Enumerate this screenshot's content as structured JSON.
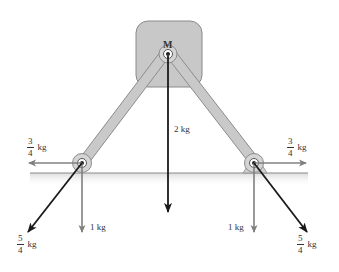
{
  "diagram": {
    "colors": {
      "block_fill": "#c8c8c8",
      "block_stroke": "#8a8a8a",
      "rod_fill": "#c9c9c9",
      "rod_stroke": "#8c8c8c",
      "ground_line": "#8c8c8c",
      "ground_shade": "#e6e6e6",
      "gray_arrow": "#808080",
      "dark_arrow": "#1a1a1a",
      "text": "#333333"
    },
    "top_block": {
      "label": "M"
    },
    "forces": {
      "center_down": {
        "label": "2 kg"
      },
      "left_horizontal": {
        "num": "3",
        "den": "4",
        "unit": "kg"
      },
      "right_horizontal": {
        "num": "3",
        "den": "4",
        "unit": "kg"
      },
      "left_down": {
        "label": "1 kg"
      },
      "right_down": {
        "label": "1 kg"
      },
      "left_diagonal": {
        "num": "5",
        "den": "4",
        "unit": "kg"
      },
      "right_diagonal": {
        "num": "5",
        "den": "4",
        "unit": "kg"
      }
    }
  }
}
